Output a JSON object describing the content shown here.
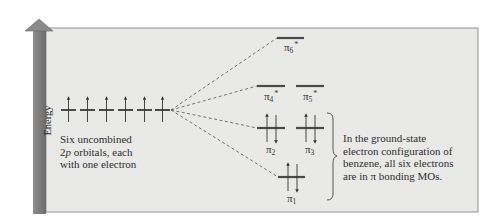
{
  "axis": {
    "label": "Energy",
    "direction": "up"
  },
  "colors": {
    "panel_bg": "#e9e9e8",
    "panel_border": "#7a7a7a",
    "energy_bar": "#858585",
    "energy_bar_dark": "#6a6a6a",
    "level_line": "#4a4a4a",
    "dashed_line": "#555555",
    "text": "#2e2e2e"
  },
  "atomic_orbitals": {
    "count": 6,
    "type": "2p",
    "electrons_each": 1,
    "caption_lines": [
      "Six uncombined",
      "2p orbitals, each",
      "with one electron"
    ]
  },
  "molecular_orbitals": [
    {
      "name": "π1",
      "base": "π",
      "sub": "1",
      "star": false,
      "electrons": 2,
      "type": "bonding"
    },
    {
      "name": "π2",
      "base": "π",
      "sub": "2",
      "star": false,
      "electrons": 2,
      "type": "bonding"
    },
    {
      "name": "π3",
      "base": "π",
      "sub": "3",
      "star": false,
      "electrons": 2,
      "type": "bonding"
    },
    {
      "name": "π4*",
      "base": "π",
      "sub": "4",
      "star": true,
      "electrons": 0,
      "type": "antibonding"
    },
    {
      "name": "π5*",
      "base": "π",
      "sub": "5",
      "star": true,
      "electrons": 0,
      "type": "antibonding"
    },
    {
      "name": "π6*",
      "base": "π",
      "sub": "6",
      "star": true,
      "electrons": 0,
      "type": "antibonding"
    }
  ],
  "note": {
    "lines": [
      "In the ground-state",
      "electron configuration of",
      "benzene, all six electrons",
      "are in π bonding MOs."
    ]
  },
  "labels": {
    "pi": "π",
    "star": "*",
    "sub1": "1",
    "sub2": "2",
    "sub3": "3",
    "sub4": "4",
    "sub5": "5",
    "sub6": "6",
    "two": "2",
    "p": "p",
    "caption_rest": " orbitals, each"
  }
}
